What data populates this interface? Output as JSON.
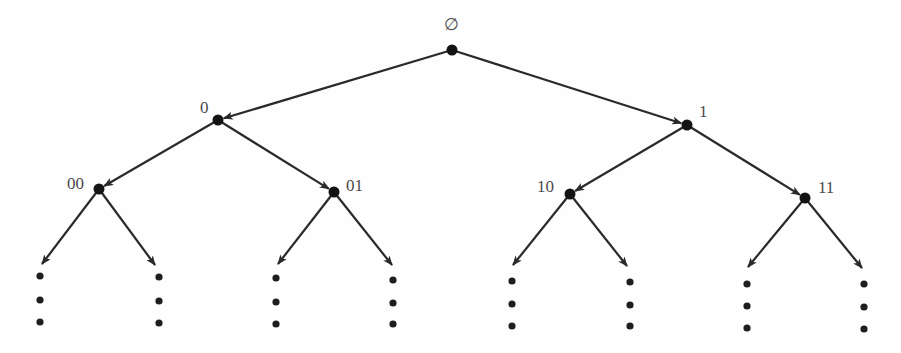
{
  "diagram": {
    "type": "binary-tree",
    "colors": {
      "edge": "#2a2a2a",
      "node": "#141414",
      "label": "#4a4a4a",
      "background": "#fefefe"
    },
    "nodes": [
      {
        "id": "root",
        "label": "∅",
        "x": 452,
        "y": 50,
        "label_x": 444,
        "label_y": 30
      },
      {
        "id": "n0",
        "label": "0",
        "x": 218,
        "y": 120,
        "label_x": 200,
        "label_y": 113
      },
      {
        "id": "n1",
        "label": "1",
        "x": 687,
        "y": 125,
        "label_x": 699,
        "label_y": 117
      },
      {
        "id": "n00",
        "label": "00",
        "x": 99,
        "y": 189,
        "label_x": 67,
        "label_y": 189
      },
      {
        "id": "n01",
        "label": "01",
        "x": 334,
        "y": 192,
        "label_x": 346,
        "label_y": 191
      },
      {
        "id": "n10",
        "label": "10",
        "x": 570,
        "y": 194,
        "label_x": 537,
        "label_y": 192
      },
      {
        "id": "n11",
        "label": "11",
        "x": 805,
        "y": 198,
        "label_x": 818,
        "label_y": 193
      }
    ],
    "edges": [
      {
        "from": "root",
        "to": "n0",
        "x1": 452,
        "y1": 50,
        "x2": 218,
        "y2": 120
      },
      {
        "from": "root",
        "to": "n1",
        "x1": 452,
        "y1": 50,
        "x2": 687,
        "y2": 125
      },
      {
        "from": "n0",
        "to": "n00",
        "x1": 218,
        "y1": 120,
        "x2": 99,
        "y2": 189
      },
      {
        "from": "n0",
        "to": "n01",
        "x1": 218,
        "y1": 120,
        "x2": 334,
        "y2": 192
      },
      {
        "from": "n1",
        "to": "n10",
        "x1": 687,
        "y1": 125,
        "x2": 570,
        "y2": 194
      },
      {
        "from": "n1",
        "to": "n11",
        "x1": 687,
        "y1": 125,
        "x2": 805,
        "y2": 198
      }
    ],
    "leaf_edges": [
      {
        "from": "n00",
        "x1": 99,
        "y1": 189,
        "x2": 42,
        "y2": 264
      },
      {
        "from": "n00",
        "x1": 99,
        "y1": 189,
        "x2": 155,
        "y2": 265
      },
      {
        "from": "n01",
        "x1": 334,
        "y1": 192,
        "x2": 278,
        "y2": 264
      },
      {
        "from": "n01",
        "x1": 334,
        "y1": 192,
        "x2": 392,
        "y2": 265
      },
      {
        "from": "n10",
        "x1": 570,
        "y1": 194,
        "x2": 513,
        "y2": 265
      },
      {
        "from": "n10",
        "x1": 570,
        "y1": 194,
        "x2": 627,
        "y2": 266
      },
      {
        "from": "n11",
        "x1": 805,
        "y1": 198,
        "x2": 748,
        "y2": 267
      },
      {
        "from": "n11",
        "x1": 805,
        "y1": 198,
        "x2": 862,
        "y2": 268
      }
    ],
    "ellipsis_columns": [
      {
        "x": 40,
        "ys": [
          276,
          300,
          322
        ]
      },
      {
        "x": 159,
        "ys": [
          277,
          301,
          323
        ]
      },
      {
        "x": 276,
        "ys": [
          278,
          302,
          324
        ]
      },
      {
        "x": 393,
        "ys": [
          280,
          303,
          324
        ]
      },
      {
        "x": 512,
        "ys": [
          281,
          304,
          326
        ]
      },
      {
        "x": 630,
        "ys": [
          282,
          305,
          326
        ]
      },
      {
        "x": 747,
        "ys": [
          284,
          306,
          328
        ]
      },
      {
        "x": 864,
        "ys": [
          284,
          307,
          329
        ]
      }
    ]
  }
}
